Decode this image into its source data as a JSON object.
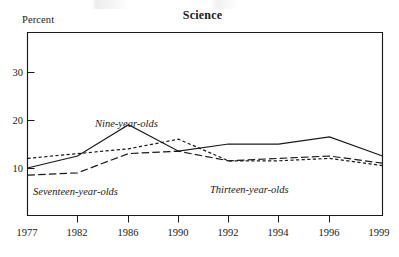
{
  "figure": {
    "title": "Science",
    "y_axis_caption": "Percent"
  },
  "chart_data": {
    "type": "line",
    "title": "Science",
    "xlabel": "",
    "ylabel": "Percent",
    "ylim": [
      0,
      35
    ],
    "yticks": [
      10,
      20,
      30
    ],
    "grid": false,
    "legend": "inline-labels",
    "x": [
      1977,
      1982,
      1986,
      1990,
      1992,
      1994,
      1996,
      1999
    ],
    "xtick_labels": [
      "1977",
      "1982",
      "1986",
      "1990",
      "1992",
      "1994",
      "1996",
      "1999"
    ],
    "series": [
      {
        "name": "Nine-year-olds",
        "style": "solid",
        "values": [
          10.0,
          12.5,
          19.0,
          13.5,
          15.0,
          15.0,
          16.5,
          12.5
        ],
        "label_text": "Nine-year-olds"
      },
      {
        "name": "Thirteen-year-olds",
        "style": "dotted",
        "values": [
          12.0,
          13.0,
          14.0,
          16.0,
          11.5,
          11.5,
          12.0,
          10.5
        ],
        "label_text": "Thirteen-year-olds"
      },
      {
        "name": "Seventeen-year-olds",
        "style": "dashed",
        "values": [
          8.5,
          9.0,
          13.0,
          13.5,
          11.5,
          12.0,
          12.5,
          11.0
        ],
        "label_text": "Seventeen-year-olds"
      }
    ]
  },
  "tick_labels": {
    "y": [
      "30",
      "20",
      "10"
    ],
    "x": [
      "1977",
      "1982",
      "1986",
      "1990",
      "1992",
      "1994",
      "1996",
      "1999"
    ]
  },
  "series_labels": {
    "nine": "Nine-year-olds",
    "thirteen": "Thirteen-year-olds",
    "seventeen": "Seventeen-year-olds"
  }
}
